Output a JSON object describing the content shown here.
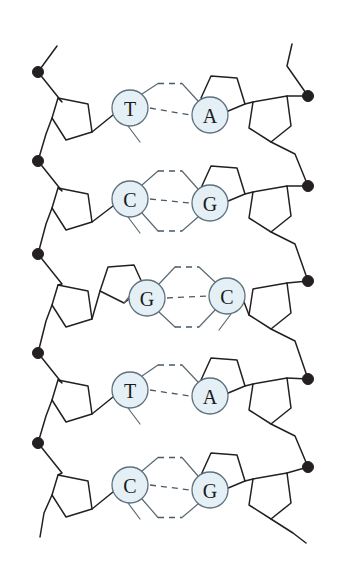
{
  "diagram": {
    "title": "DNA Double Helix Base Pairing",
    "type": "dna-double-helix",
    "background_color": "#ffffff",
    "colors": {
      "backbone_stroke": "#241f20",
      "phosphate_fill": "#241f20",
      "base_circle_fill": "#e4f0f5",
      "base_circle_stroke": "#5d717d",
      "base_letter": "#1a1a1a",
      "hydrogen_bond": "#4a5a66",
      "base_ring_stroke": "#5a6a74"
    },
    "legend_notes": {
      "phosphate": "black filled circle",
      "sugar": "pentagon (deoxyribose)",
      "base": "lettered circle",
      "hydrogen_bond": "dashed line"
    }
  },
  "base_pairs": [
    {
      "index": 1,
      "left_base": "T",
      "right_base": "A",
      "hydrogen_bonds": 2,
      "left_type": "pyrimidine",
      "right_type": "purine",
      "row_center_y": 110,
      "left_circle": {
        "cx": 130,
        "cy": 108,
        "r": 18
      },
      "right_circle": {
        "cx": 210,
        "cy": 115,
        "r": 18
      }
    },
    {
      "index": 2,
      "left_base": "C",
      "right_base": "G",
      "hydrogen_bonds": 3,
      "left_type": "pyrimidine",
      "right_type": "purine",
      "row_center_y": 200,
      "left_circle": {
        "cx": 130,
        "cy": 199,
        "r": 18
      },
      "right_circle": {
        "cx": 210,
        "cy": 203,
        "r": 18
      }
    },
    {
      "index": 3,
      "left_base": "G",
      "right_base": "C",
      "hydrogen_bonds": 3,
      "left_type": "purine",
      "right_type": "pyrimidine",
      "row_center_y": 297,
      "left_circle": {
        "cx": 147,
        "cy": 298,
        "r": 18
      },
      "right_circle": {
        "cx": 227,
        "cy": 296,
        "r": 18
      }
    },
    {
      "index": 4,
      "left_base": "T",
      "right_base": "A",
      "hydrogen_bonds": 2,
      "left_type": "pyrimidine",
      "right_type": "purine",
      "row_center_y": 392,
      "left_circle": {
        "cx": 130,
        "cy": 390,
        "r": 18
      },
      "right_circle": {
        "cx": 210,
        "cy": 396,
        "r": 18
      }
    },
    {
      "index": 5,
      "left_base": "C",
      "right_base": "G",
      "hydrogen_bonds": 3,
      "left_type": "pyrimidine",
      "right_type": "purine",
      "row_center_y": 487,
      "left_circle": {
        "cx": 130,
        "cy": 485,
        "r": 18
      },
      "right_circle": {
        "cx": 210,
        "cy": 490,
        "r": 18
      }
    }
  ],
  "strands": {
    "left": {
      "name": "left-backbone",
      "direction_label": "",
      "phosphate_count": 5,
      "phosphates": [
        {
          "cx": 38,
          "cy": 72
        },
        {
          "cx": 38,
          "cy": 161
        },
        {
          "cx": 38,
          "cy": 254
        },
        {
          "cx": 38,
          "cy": 353
        },
        {
          "cx": 38,
          "cy": 443
        }
      ]
    },
    "right": {
      "name": "right-backbone",
      "direction_label": "",
      "phosphate_count": 5,
      "phosphates": [
        {
          "cx": 308,
          "cy": 96
        },
        {
          "cx": 308,
          "cy": 186
        },
        {
          "cx": 308,
          "cy": 281
        },
        {
          "cx": 308,
          "cy": 379
        },
        {
          "cx": 308,
          "cy": 467
        }
      ]
    }
  }
}
